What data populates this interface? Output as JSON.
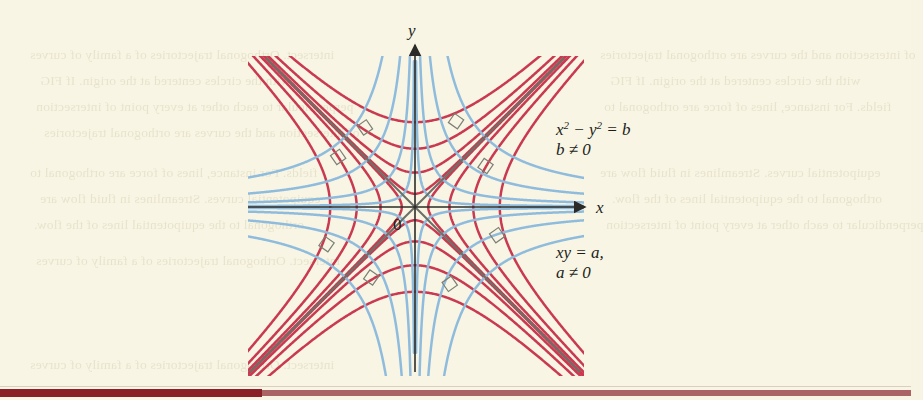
{
  "page": {
    "background_color": "#f8f5e4",
    "bottom_rule_dark_color": "#8a1f28",
    "bottom_rule_light_color": "#9e4a4f"
  },
  "figure": {
    "origin_label": "0",
    "x_axis_label": "x",
    "y_axis_label": "y",
    "annotations": [
      {
        "id": "red-family",
        "line1": "x2 − y2 = b",
        "line1_base": "x",
        "line1_rest": " − y",
        "line1_tail": " = b",
        "line2": "b ≠ 0"
      },
      {
        "id": "blue-family",
        "line1": "xy = a,",
        "line2": "a ≠ 0"
      }
    ],
    "colors": {
      "red_curve": "#c9394f",
      "blue_curve": "#8fbcdd",
      "asymptote": "#6e7068",
      "axis": "#2b2b28",
      "right_angle_mark": "#7d7f74"
    }
  },
  "chart_data": {
    "type": "line",
    "xlabel": "x",
    "ylabel": "y",
    "xlim": [
      -6.5,
      6.5
    ],
    "ylim": [
      -5.2,
      5.2
    ],
    "grid": false,
    "legend_position": "none",
    "origin_label": "0",
    "series": [
      {
        "name": "x^2 - y^2 = b,  b ≠ 0",
        "color": "#c9394f",
        "equation": "x^2 - y^2 = b",
        "constraint": "b ≠ 0",
        "parameter": "b",
        "parameter_values": [
          -10.24,
          -4.84,
          -1.69,
          -0.25,
          0.25,
          1.69,
          4.84,
          10.24
        ],
        "branch_count": 16,
        "description": "Rectangular hyperbolas opening left/right for b>0 and up/down for b<0"
      },
      {
        "name": "xy = a,  a ≠ 0",
        "color": "#8fbcdd",
        "equation": "xy = a",
        "constraint": "a ≠ 0",
        "parameter": "a",
        "parameter_values": [
          -7.0,
          -3.2,
          -1.1,
          -0.22,
          0.22,
          1.1,
          3.2,
          7.0
        ],
        "branch_count": 16,
        "description": "Rectangular hyperbolas with the coordinate axes as asymptotes"
      },
      {
        "name": "asymptotes y = x and y = -x",
        "color": "#6e7068",
        "equations": [
          "y = x",
          "y = -x"
        ],
        "description": "Common asymptotes of the x^2 - y^2 = b family"
      }
    ],
    "annotations": [
      {
        "text": "x2 − y2 = b",
        "x": 3.1,
        "y": 2.2
      },
      {
        "text": "b ≠ 0",
        "x": 3.1,
        "y": 1.75
      },
      {
        "text": "xy = a,",
        "x": 3.1,
        "y": -1.15
      },
      {
        "text": "a ≠ 0",
        "x": 3.1,
        "y": -1.6
      }
    ],
    "right_angle_marks": 8,
    "note": "The two families intersect orthogonally; small square marks denote right angles at intersections."
  },
  "bleed_text": {
    "lines": [
      "intersect. Orthogonal trajectories of a family of curves",
      "with the circles centered at the origin. If FIG",
      "perpendicular to each other at every point of intersection",
      "of intersection and the curves are orthogonal trajectories",
      "fields. For instance, lines of force are orthogonal to",
      "equipotential curves. Streamlines in fluid flow are",
      "orthogonal to the equipotential lines of the flow."
    ]
  }
}
